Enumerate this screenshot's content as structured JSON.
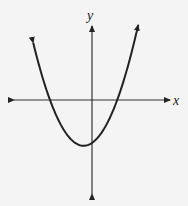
{
  "chart_data": {
    "type": "line",
    "title": "",
    "xlabel": "x",
    "ylabel": "y",
    "grid": false,
    "xlim": [
      -8,
      8
    ],
    "ylim": [
      -8,
      7
    ],
    "curve": {
      "form": "quadratic",
      "vertex": [
        -0.8,
        -4.2
      ],
      "x_intercepts": [
        -4.0,
        2.4
      ],
      "y_intercept": -4.0,
      "x_range": [
        -5.6,
        4.4
      ]
    },
    "colors": {
      "stroke": "#222222",
      "background": "#f4f4f4"
    }
  }
}
